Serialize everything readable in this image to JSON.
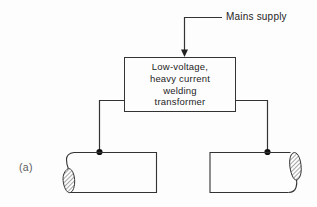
{
  "figure": {
    "panel_label": "(a)",
    "background_color": "#fdfdfd",
    "line_color": "#333333",
    "text_color": "#1e1e1e",
    "dot_color": "#111111"
  },
  "labels": {
    "mains_supply": "Mains supply"
  },
  "transformer_box": {
    "label_lines": [
      "Low-voltage,",
      "heavy current",
      "welding",
      "transformer"
    ]
  }
}
